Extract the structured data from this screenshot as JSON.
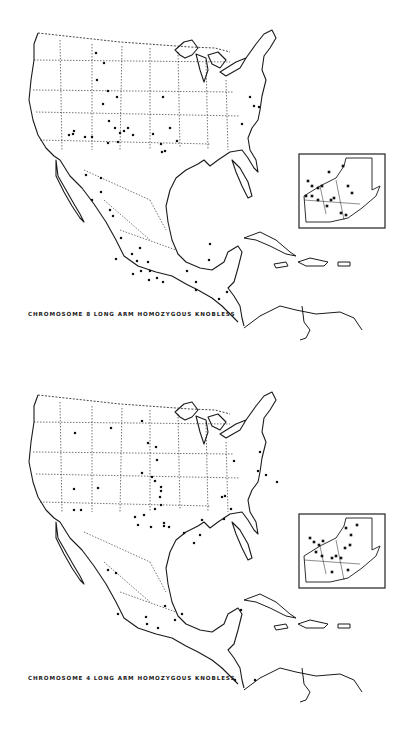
{
  "figure": {
    "maps": [
      {
        "id": "chromosome-8",
        "caption": "CHROMOSOME 8 LONG ARM HOMOZYGOUS KNOBLESS",
        "inset_region": "Guatemala",
        "points": [
          [
            96,
            53
          ],
          [
            104,
            63
          ],
          [
            97,
            80
          ],
          [
            108,
            91
          ],
          [
            117,
            97
          ],
          [
            103,
            104
          ],
          [
            109,
            121
          ],
          [
            115,
            128
          ],
          [
            120,
            133
          ],
          [
            124,
            131
          ],
          [
            128,
            128
          ],
          [
            133,
            135
          ],
          [
            118,
            142
          ],
          [
            74,
            131
          ],
          [
            69,
            135
          ],
          [
            73,
            134
          ],
          [
            85,
            137
          ],
          [
            92,
            137
          ],
          [
            108,
            143
          ],
          [
            163,
            97
          ],
          [
            153,
            134
          ],
          [
            161,
            144
          ],
          [
            162,
            152
          ],
          [
            165,
            151
          ],
          [
            170,
            128
          ],
          [
            177,
            141
          ],
          [
            250,
            97
          ],
          [
            254,
            106
          ],
          [
            259,
            107
          ],
          [
            242,
            124
          ],
          [
            86,
            175
          ],
          [
            101,
            178
          ],
          [
            101,
            192
          ],
          [
            92,
            200
          ],
          [
            110,
            210
          ],
          [
            113,
            216
          ],
          [
            121,
            238
          ],
          [
            116,
            259
          ],
          [
            132,
            254
          ],
          [
            140,
            248
          ],
          [
            137,
            261
          ],
          [
            148,
            262
          ],
          [
            150,
            271
          ],
          [
            141,
            271
          ],
          [
            133,
            274
          ],
          [
            149,
            280
          ],
          [
            163,
            282
          ],
          [
            157,
            278
          ],
          [
            187,
            271
          ],
          [
            196,
            282
          ],
          [
            196,
            290
          ],
          [
            210,
            244
          ],
          [
            209,
            260
          ],
          [
            219,
            299
          ],
          [
            227,
            292
          ]
        ],
        "inset_points": [
          [
            308,
            181
          ],
          [
            312,
            186
          ],
          [
            318,
            188
          ],
          [
            322,
            186
          ],
          [
            312,
            196
          ],
          [
            318,
            200
          ],
          [
            306,
            196
          ],
          [
            331,
            200
          ],
          [
            334,
            198
          ],
          [
            348,
            186
          ],
          [
            352,
            193
          ],
          [
            341,
            213
          ],
          [
            346,
            215
          ],
          [
            327,
            206
          ],
          [
            329,
            172
          ],
          [
            343,
            166
          ]
        ]
      },
      {
        "id": "chromosome-4",
        "caption": "CHROMOSOME 4 LONG ARM HOMOZYGOUS KNOBLESS",
        "inset_region": "Guatemala",
        "points": [
          [
            75,
            433
          ],
          [
            74,
            489
          ],
          [
            98,
            488
          ],
          [
            74,
            510
          ],
          [
            81,
            510
          ],
          [
            111,
            428
          ],
          [
            148,
            443
          ],
          [
            142,
            421
          ],
          [
            156,
            447
          ],
          [
            157,
            460
          ],
          [
            142,
            473
          ],
          [
            152,
            477
          ],
          [
            155,
            481
          ],
          [
            161,
            487
          ],
          [
            161,
            491
          ],
          [
            160,
            497
          ],
          [
            155,
            509
          ],
          [
            161,
            505
          ],
          [
            144,
            515
          ],
          [
            135,
            517
          ],
          [
            138,
            525
          ],
          [
            151,
            527
          ],
          [
            164,
            523
          ],
          [
            164,
            526
          ],
          [
            169,
            527
          ],
          [
            184,
            533
          ],
          [
            194,
            543
          ],
          [
            200,
            535
          ],
          [
            202,
            520
          ],
          [
            222,
            497
          ],
          [
            225,
            496
          ],
          [
            224,
            519
          ],
          [
            231,
            509
          ],
          [
            234,
            461
          ],
          [
            260,
            452
          ],
          [
            258,
            471
          ],
          [
            266,
            475
          ],
          [
            277,
            482
          ],
          [
            108,
            570
          ],
          [
            116,
            573
          ],
          [
            118,
            614
          ],
          [
            146,
            617
          ],
          [
            147,
            624
          ],
          [
            158,
            628
          ],
          [
            165,
            606
          ],
          [
            175,
            620
          ],
          [
            182,
            614
          ],
          [
            241,
            610
          ],
          [
            255,
            680
          ],
          [
            235,
            680
          ]
        ],
        "inset_points": [
          [
            310,
            538
          ],
          [
            314,
            542
          ],
          [
            319,
            545
          ],
          [
            323,
            541
          ],
          [
            316,
            552
          ],
          [
            322,
            556
          ],
          [
            332,
            558
          ],
          [
            336,
            556
          ],
          [
            345,
            548
          ],
          [
            350,
            545
          ],
          [
            351,
            535
          ],
          [
            346,
            528
          ],
          [
            341,
            558
          ],
          [
            332,
            572
          ],
          [
            348,
            570
          ],
          [
            357,
            525
          ]
        ]
      }
    ]
  },
  "colors": {
    "ink": "#1a1a1a",
    "paper": "#ffffff"
  }
}
